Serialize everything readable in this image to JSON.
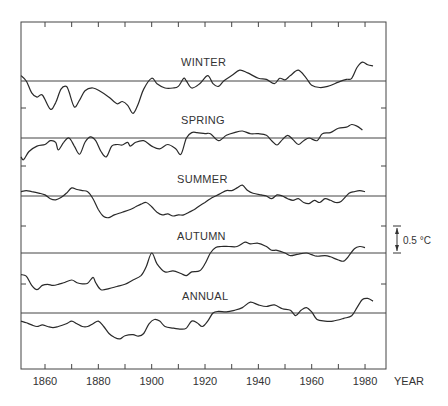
{
  "chart_data": {
    "type": "line",
    "title": "",
    "xlabel": "YEAR",
    "ylabel": "",
    "xlim": [
      1851,
      1988
    ],
    "x_ticks": [
      1860,
      1880,
      1900,
      1920,
      1940,
      1960,
      1980
    ],
    "x_minor_ticks": [
      1850,
      1860,
      1870,
      1880,
      1890,
      1900,
      1910,
      1920,
      1930,
      1940,
      1950,
      1960,
      1970,
      1980
    ],
    "scale_bar": {
      "label": "0.5 °C",
      "value_c": 0.5
    },
    "grid": false,
    "legend": null,
    "units": "temperature anomaly (°C), panels offset vertically",
    "series": [
      {
        "name": "WINTER",
        "points": [
          [
            1851,
            0.1
          ],
          [
            1853,
            0.0
          ],
          [
            1855,
            -0.22
          ],
          [
            1857,
            -0.3
          ],
          [
            1859,
            -0.26
          ],
          [
            1862,
            -0.52
          ],
          [
            1864,
            -0.4
          ],
          [
            1866,
            -0.15
          ],
          [
            1868,
            -0.1
          ],
          [
            1869,
            -0.2
          ],
          [
            1871,
            -0.48
          ],
          [
            1873,
            -0.35
          ],
          [
            1875,
            -0.18
          ],
          [
            1878,
            -0.13
          ],
          [
            1881,
            -0.2
          ],
          [
            1884,
            -0.3
          ],
          [
            1887,
            -0.42
          ],
          [
            1889,
            -0.38
          ],
          [
            1891,
            -0.45
          ],
          [
            1893,
            -0.6
          ],
          [
            1895,
            -0.42
          ],
          [
            1897,
            -0.15
          ],
          [
            1900,
            0.05
          ],
          [
            1902,
            -0.05
          ],
          [
            1905,
            -0.13
          ],
          [
            1908,
            -0.13
          ],
          [
            1910,
            -0.1
          ],
          [
            1912,
            0.05
          ],
          [
            1913,
            0.0
          ],
          [
            1915,
            -0.13
          ],
          [
            1918,
            -0.05
          ],
          [
            1921,
            0.1
          ],
          [
            1923,
            -0.05
          ],
          [
            1925,
            -0.1
          ],
          [
            1927,
            0.0
          ],
          [
            1930,
            0.1
          ],
          [
            1933,
            0.2
          ],
          [
            1936,
            0.15
          ],
          [
            1940,
            0.05
          ],
          [
            1943,
            0.03
          ],
          [
            1946,
            -0.05
          ],
          [
            1948,
            0.05
          ],
          [
            1950,
            0.02
          ],
          [
            1952,
            0.1
          ],
          [
            1955,
            0.2
          ],
          [
            1958,
            0.05
          ],
          [
            1960,
            -0.08
          ],
          [
            1963,
            -0.12
          ],
          [
            1966,
            -0.1
          ],
          [
            1970,
            -0.02
          ],
          [
            1973,
            0.03
          ],
          [
            1975,
            0.05
          ],
          [
            1977,
            0.25
          ],
          [
            1979,
            0.35
          ],
          [
            1981,
            0.3
          ],
          [
            1983,
            0.28
          ]
        ]
      },
      {
        "name": "SPRING",
        "points": [
          [
            1851,
            -0.35
          ],
          [
            1852,
            -0.4
          ],
          [
            1854,
            -0.25
          ],
          [
            1857,
            -0.15
          ],
          [
            1860,
            -0.12
          ],
          [
            1862,
            -0.05
          ],
          [
            1864,
            -0.08
          ],
          [
            1865,
            -0.22
          ],
          [
            1867,
            -0.08
          ],
          [
            1869,
            0.0
          ],
          [
            1871,
            -0.15
          ],
          [
            1873,
            -0.3
          ],
          [
            1875,
            -0.08
          ],
          [
            1877,
            0.02
          ],
          [
            1879,
            -0.05
          ],
          [
            1881,
            -0.25
          ],
          [
            1883,
            -0.35
          ],
          [
            1885,
            -0.15
          ],
          [
            1887,
            -0.12
          ],
          [
            1889,
            -0.13
          ],
          [
            1891,
            -0.08
          ],
          [
            1892,
            -0.15
          ],
          [
            1894,
            -0.08
          ],
          [
            1897,
            -0.05
          ],
          [
            1900,
            -0.15
          ],
          [
            1903,
            -0.2
          ],
          [
            1906,
            -0.12
          ],
          [
            1909,
            -0.2
          ],
          [
            1911,
            -0.3
          ],
          [
            1913,
            0.0
          ],
          [
            1915,
            0.1
          ],
          [
            1917,
            0.1
          ],
          [
            1920,
            0.08
          ],
          [
            1922,
            0.08
          ],
          [
            1925,
            -0.05
          ],
          [
            1928,
            0.05
          ],
          [
            1931,
            0.1
          ],
          [
            1934,
            0.13
          ],
          [
            1937,
            0.08
          ],
          [
            1940,
            0.08
          ],
          [
            1943,
            0.05
          ],
          [
            1945,
            -0.05
          ],
          [
            1947,
            -0.13
          ],
          [
            1949,
            -0.03
          ],
          [
            1951,
            0.05
          ],
          [
            1953,
            -0.03
          ],
          [
            1955,
            -0.12
          ],
          [
            1957,
            -0.05
          ],
          [
            1959,
            0.0
          ],
          [
            1962,
            -0.05
          ],
          [
            1964,
            0.08
          ],
          [
            1967,
            0.1
          ],
          [
            1970,
            0.18
          ],
          [
            1973,
            0.2
          ],
          [
            1975,
            0.25
          ],
          [
            1977,
            0.22
          ],
          [
            1979,
            0.15
          ]
        ]
      },
      {
        "name": "SUMMER",
        "points": [
          [
            1851,
            0.08
          ],
          [
            1853,
            0.1
          ],
          [
            1855,
            0.08
          ],
          [
            1858,
            0.05
          ],
          [
            1860,
            0.02
          ],
          [
            1862,
            -0.05
          ],
          [
            1864,
            -0.07
          ],
          [
            1866,
            -0.03
          ],
          [
            1868,
            0.05
          ],
          [
            1870,
            0.15
          ],
          [
            1872,
            0.12
          ],
          [
            1874,
            0.1
          ],
          [
            1876,
            0.08
          ],
          [
            1878,
            -0.05
          ],
          [
            1880,
            -0.25
          ],
          [
            1882,
            -0.38
          ],
          [
            1884,
            -0.4
          ],
          [
            1886,
            -0.35
          ],
          [
            1889,
            -0.3
          ],
          [
            1892,
            -0.25
          ],
          [
            1894,
            -0.2
          ],
          [
            1896,
            -0.15
          ],
          [
            1898,
            -0.12
          ],
          [
            1900,
            -0.2
          ],
          [
            1902,
            -0.3
          ],
          [
            1904,
            -0.35
          ],
          [
            1906,
            -0.33
          ],
          [
            1908,
            -0.37
          ],
          [
            1910,
            -0.35
          ],
          [
            1912,
            -0.35
          ],
          [
            1914,
            -0.3
          ],
          [
            1916,
            -0.25
          ],
          [
            1918,
            -0.18
          ],
          [
            1920,
            -0.12
          ],
          [
            1922,
            -0.05
          ],
          [
            1924,
            0.0
          ],
          [
            1926,
            0.05
          ],
          [
            1928,
            0.1
          ],
          [
            1930,
            0.1
          ],
          [
            1932,
            0.15
          ],
          [
            1934,
            0.2
          ],
          [
            1936,
            0.1
          ],
          [
            1938,
            0.05
          ],
          [
            1941,
            0.02
          ],
          [
            1943,
            0.0
          ],
          [
            1945,
            -0.05
          ],
          [
            1947,
            0.02
          ],
          [
            1949,
            0.0
          ],
          [
            1951,
            -0.05
          ],
          [
            1953,
            -0.08
          ],
          [
            1955,
            -0.05
          ],
          [
            1957,
            -0.12
          ],
          [
            1959,
            -0.14
          ],
          [
            1961,
            -0.08
          ],
          [
            1963,
            -0.12
          ],
          [
            1965,
            -0.05
          ],
          [
            1967,
            -0.08
          ],
          [
            1969,
            -0.12
          ],
          [
            1971,
            -0.1
          ],
          [
            1974,
            0.05
          ],
          [
            1976,
            0.08
          ],
          [
            1978,
            0.1
          ],
          [
            1980,
            0.08
          ]
        ]
      },
      {
        "name": "AUTUMN",
        "points": [
          [
            1851,
            -0.4
          ],
          [
            1853,
            -0.43
          ],
          [
            1855,
            -0.6
          ],
          [
            1857,
            -0.68
          ],
          [
            1859,
            -0.6
          ],
          [
            1861,
            -0.58
          ],
          [
            1863,
            -0.6
          ],
          [
            1865,
            -0.58
          ],
          [
            1867,
            -0.55
          ],
          [
            1870,
            -0.5
          ],
          [
            1872,
            -0.55
          ],
          [
            1874,
            -0.57
          ],
          [
            1876,
            -0.56
          ],
          [
            1878,
            -0.45
          ],
          [
            1879,
            -0.55
          ],
          [
            1881,
            -0.68
          ],
          [
            1884,
            -0.66
          ],
          [
            1887,
            -0.62
          ],
          [
            1890,
            -0.58
          ],
          [
            1893,
            -0.5
          ],
          [
            1896,
            -0.42
          ],
          [
            1898,
            -0.25
          ],
          [
            1900,
            0.0
          ],
          [
            1902,
            -0.2
          ],
          [
            1905,
            -0.35
          ],
          [
            1908,
            -0.33
          ],
          [
            1911,
            -0.38
          ],
          [
            1913,
            -0.42
          ],
          [
            1915,
            -0.35
          ],
          [
            1918,
            -0.33
          ],
          [
            1920,
            -0.2
          ],
          [
            1922,
            0.0
          ],
          [
            1924,
            0.1
          ],
          [
            1926,
            0.12
          ],
          [
            1929,
            0.12
          ],
          [
            1932,
            0.12
          ],
          [
            1935,
            0.2
          ],
          [
            1937,
            0.17
          ],
          [
            1940,
            0.18
          ],
          [
            1943,
            0.12
          ],
          [
            1945,
            0.05
          ],
          [
            1947,
            0.05
          ],
          [
            1950,
            0.0
          ],
          [
            1952,
            -0.05
          ],
          [
            1955,
            -0.02
          ],
          [
            1958,
            0.0
          ],
          [
            1960,
            -0.03
          ],
          [
            1962,
            -0.06
          ],
          [
            1965,
            -0.05
          ],
          [
            1967,
            -0.07
          ],
          [
            1970,
            -0.13
          ],
          [
            1972,
            -0.15
          ],
          [
            1974,
            -0.05
          ],
          [
            1976,
            0.08
          ],
          [
            1978,
            0.12
          ],
          [
            1980,
            0.1
          ]
        ]
      },
      {
        "name": "ANNUAL",
        "points": [
          [
            1851,
            -0.15
          ],
          [
            1853,
            -0.18
          ],
          [
            1855,
            -0.22
          ],
          [
            1857,
            -0.25
          ],
          [
            1859,
            -0.22
          ],
          [
            1861,
            -0.25
          ],
          [
            1863,
            -0.27
          ],
          [
            1865,
            -0.25
          ],
          [
            1868,
            -0.2
          ],
          [
            1870,
            -0.15
          ],
          [
            1872,
            -0.2
          ],
          [
            1874,
            -0.25
          ],
          [
            1876,
            -0.25
          ],
          [
            1878,
            -0.2
          ],
          [
            1880,
            -0.15
          ],
          [
            1882,
            -0.25
          ],
          [
            1884,
            -0.38
          ],
          [
            1886,
            -0.45
          ],
          [
            1888,
            -0.48
          ],
          [
            1890,
            -0.42
          ],
          [
            1893,
            -0.4
          ],
          [
            1895,
            -0.43
          ],
          [
            1897,
            -0.38
          ],
          [
            1899,
            -0.2
          ],
          [
            1901,
            -0.12
          ],
          [
            1903,
            -0.15
          ],
          [
            1905,
            -0.25
          ],
          [
            1908,
            -0.28
          ],
          [
            1911,
            -0.3
          ],
          [
            1913,
            -0.28
          ],
          [
            1915,
            -0.15
          ],
          [
            1917,
            -0.18
          ],
          [
            1919,
            -0.25
          ],
          [
            1921,
            -0.15
          ],
          [
            1923,
            0.0
          ],
          [
            1925,
            0.03
          ],
          [
            1928,
            0.02
          ],
          [
            1931,
            0.05
          ],
          [
            1934,
            0.1
          ],
          [
            1937,
            0.2
          ],
          [
            1940,
            0.15
          ],
          [
            1943,
            0.12
          ],
          [
            1946,
            0.15
          ],
          [
            1949,
            0.08
          ],
          [
            1952,
            0.05
          ],
          [
            1954,
            -0.05
          ],
          [
            1956,
            0.05
          ],
          [
            1958,
            0.1
          ],
          [
            1960,
            0.02
          ],
          [
            1962,
            -0.12
          ],
          [
            1965,
            -0.15
          ],
          [
            1968,
            -0.15
          ],
          [
            1972,
            -0.1
          ],
          [
            1975,
            -0.05
          ],
          [
            1977,
            0.1
          ],
          [
            1979,
            0.25
          ],
          [
            1981,
            0.27
          ],
          [
            1983,
            0.22
          ]
        ]
      }
    ],
    "panels": [
      {
        "name": "WINTER",
        "baseline_y": 81,
        "label_x": 208,
        "label_y": 66
      },
      {
        "name": "SPRING",
        "baseline_y": 138,
        "label_x": 208,
        "label_y": 124
      },
      {
        "name": "SUMMER",
        "baseline_y": 196,
        "label_x": 202,
        "label_y": 182
      },
      {
        "name": "AUTUMN",
        "baseline_y": 253,
        "label_x": 202,
        "label_y": 239
      },
      {
        "name": "ANNUAL",
        "baseline_y": 313,
        "label_x": 208,
        "label_y": 298
      }
    ]
  },
  "labels": {
    "winter": "WINTER",
    "spring": "SPRING",
    "summer": "SUMMER",
    "autumn": "AUTUMN",
    "annual": "ANNUAL",
    "xlabel": "YEAR",
    "scale": "0.5 °C",
    "ticks": [
      "1860",
      "1880",
      "1900",
      "1920",
      "1940",
      "1960",
      "1980"
    ]
  }
}
